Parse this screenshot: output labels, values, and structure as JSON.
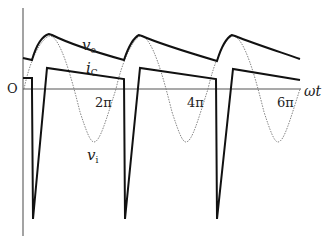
{
  "diagram": {
    "type": "waveform",
    "axis": {
      "x_label": "ωt",
      "origin_label": "O",
      "ticks": [
        "2π",
        "4π",
        "6π"
      ]
    },
    "curves": [
      {
        "name": "v_o",
        "main": "v",
        "sub": "o",
        "style": "thick solid"
      },
      {
        "name": "i_C",
        "main": "i",
        "sub": "C",
        "style": "thick solid"
      },
      {
        "name": "v_i",
        "main": "v",
        "sub": "i",
        "style": "thin dotted"
      }
    ]
  }
}
